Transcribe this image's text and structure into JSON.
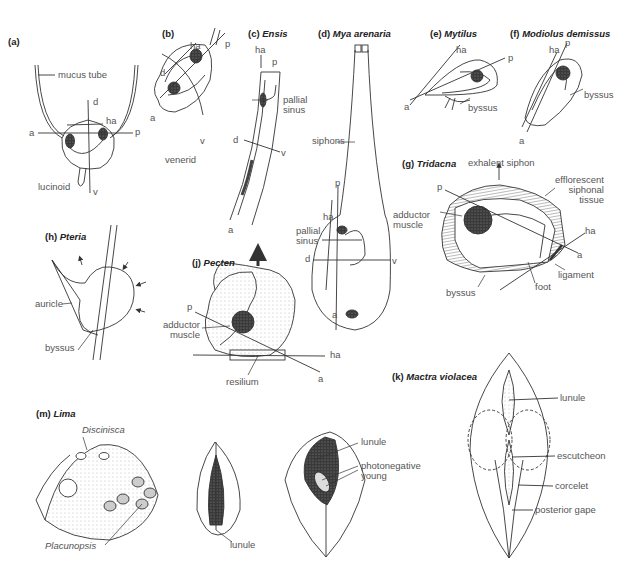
{
  "figure": {
    "panels": [
      {
        "id": "a",
        "letter": "(a)",
        "name": "",
        "labels": {
          "mucus_tube": "mucus tube",
          "d": "d",
          "ha": "ha",
          "a": "a",
          "p": "p",
          "v": "v",
          "caption": "lucinoid"
        }
      },
      {
        "id": "b",
        "letter": "(b)",
        "name": "",
        "labels": {
          "ha": "ha",
          "p": "p",
          "d": "d",
          "a": "a",
          "v": "v",
          "caption": "venerid"
        }
      },
      {
        "id": "c",
        "letter": "(c)",
        "name": "Ensis",
        "labels": {
          "ha": "ha",
          "p": "p",
          "pallial_sinus": "pallial\nsinus",
          "d": "d",
          "v": "v",
          "a": "a"
        }
      },
      {
        "id": "d",
        "letter": "(d)",
        "name": "Mya arenaria",
        "labels": {
          "siphons": "siphons",
          "p": "p",
          "ha": "ha",
          "pallial_sinus": "pallial\nsinus",
          "d": "d",
          "v": "v",
          "a": "a"
        }
      },
      {
        "id": "e",
        "letter": "(e)",
        "name": "Mytilus",
        "labels": {
          "ha": "ha",
          "p": "p",
          "a": "a",
          "byssus": "byssus"
        }
      },
      {
        "id": "f",
        "letter": "(f)",
        "name": "Modiolus demissus",
        "labels": {
          "ha": "ha",
          "p": "p",
          "byssus": "byssus",
          "a": "a"
        }
      },
      {
        "id": "g",
        "letter": "(g)",
        "name": "Tridacna",
        "labels": {
          "exhalent_siphon": "exhalent siphon",
          "p": "p",
          "efflorescent": "efflorescent\nsiphonal\ntissue",
          "adductor_muscle": "adductor\nmuscle",
          "ha": "ha",
          "a": "a",
          "ligament": "ligament",
          "foot": "foot",
          "byssus": "byssus"
        }
      },
      {
        "id": "h",
        "letter": "(h)",
        "name": "Pteria",
        "labels": {
          "auricle": "auricle",
          "byssus": "byssus"
        }
      },
      {
        "id": "j",
        "letter": "(j)",
        "name": "Pecten",
        "labels": {
          "p": "p",
          "adductor_muscle": "adductor\nmuscle",
          "ha": "ha",
          "a": "a",
          "resilium": "resilium"
        }
      },
      {
        "id": "k",
        "letter": "(k)",
        "name": "Mactra violacea",
        "labels": {
          "lunule": "lunule",
          "escutcheon": "escutcheon",
          "corcelet": "corcelet",
          "posterior_gape": "posterior gape"
        }
      },
      {
        "id": "m",
        "letter": "(m)",
        "name": "Lima",
        "labels": {
          "discinisca": "Discinisca",
          "placunopsis": "Placunopsis",
          "lunule_mid": "lunule",
          "lunule_right": "lunule",
          "photonegative_young": "photonegative\nyoung"
        }
      }
    ]
  }
}
